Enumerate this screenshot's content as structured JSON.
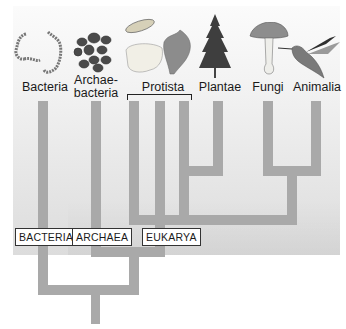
{
  "kingdoms": [
    {
      "name": "Bacteria",
      "icon": "bacteria-chain-icon"
    },
    {
      "name": "Archae-",
      "name2": "bacteria",
      "icon": "archaebacteria-cluster-icon"
    },
    {
      "name": "Protista",
      "icon": "protista-icon"
    },
    {
      "name": "Plantae",
      "icon": "conifer-tree-icon"
    },
    {
      "name": "Fungi",
      "icon": "mushroom-icon"
    },
    {
      "name": "Animalia",
      "icon": "hummingbird-icon"
    }
  ],
  "domains": [
    {
      "name": "BACTERIA"
    },
    {
      "name": "ARCHAEA"
    },
    {
      "name": "EUKARYA"
    }
  ],
  "colors": {
    "branch": "#a9a9a9",
    "panel": "#e6e6e6",
    "label_text": "#1a1a1a"
  }
}
